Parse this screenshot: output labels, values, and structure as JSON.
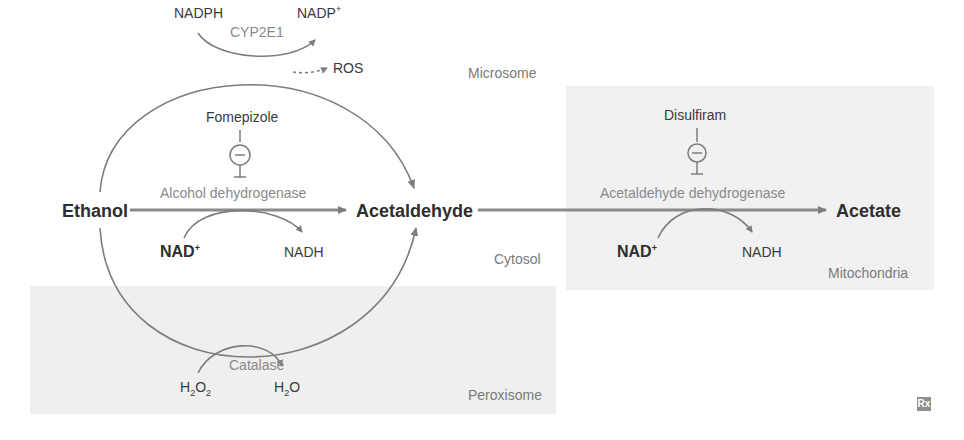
{
  "diagram": {
    "compartments": {
      "microsome": "Microsome",
      "cytosol": "Cytosol",
      "mitochondria": "Mitochondria",
      "peroxisome": "Peroxisome"
    },
    "metabolites": {
      "ethanol": "Ethanol",
      "acetaldehyde": "Acetaldehyde",
      "acetate": "Acetate"
    },
    "enzymes": {
      "cyp2e1": "CYP2E1",
      "adh": "Alcohol dehydrogenase",
      "aldh": "Acetaldehyde dehydrogenase",
      "catalase": "Catalase"
    },
    "inhibitors": {
      "fomepizole": "Fomepizole",
      "disulfiram": "Disulfiram"
    },
    "cofactors": {
      "microsome_in": "NADPH",
      "microsome_out": "NADP",
      "microsome_out_sup": "+",
      "ros": "ROS",
      "adh_in": "NAD",
      "adh_in_sup": "+",
      "adh_out": "NADH",
      "aldh_in": "NAD",
      "aldh_in_sup": "+",
      "aldh_out": "NADH",
      "catalase_in_a": "H",
      "catalase_in_sub1": "2",
      "catalase_in_b": "O",
      "catalase_in_sub2": "2",
      "catalase_out_a": "H",
      "catalase_out_sub": "2",
      "catalase_out_b": "O"
    },
    "inhibition_symbol": "−",
    "logo": "Rx",
    "colors": {
      "line": "#7d7d7d",
      "text_dark": "#3a3a3a",
      "text_enzyme": "#8a8a8a",
      "region_bg": "#f1f1f1"
    }
  }
}
